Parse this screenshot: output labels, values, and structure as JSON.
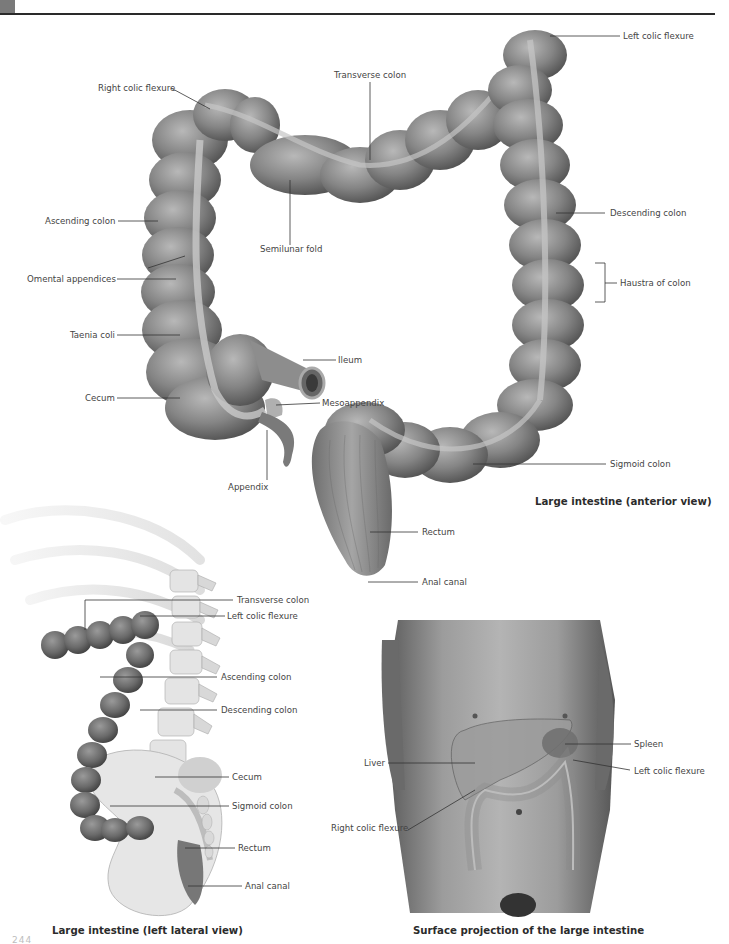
{
  "page": {
    "page_number": "244"
  },
  "figures": {
    "anterior": {
      "caption": "Large intestine (anterior view)",
      "labels": {
        "left_colic_flexure": "Left colic flexure",
        "right_colic_flexure": "Right colic flexure",
        "transverse_colon": "Transverse colon",
        "ascending_colon": "Ascending colon",
        "semilunar_fold": "Semilunar fold",
        "descending_colon": "Descending colon",
        "haustra_of_colon": "Haustra of colon",
        "omental_appendices": "Omental appendices",
        "taenia_coli": "Taenia coli",
        "ileum": "Ileum",
        "cecum": "Cecum",
        "mesoappendix": "Mesoappendix",
        "appendix": "Appendix",
        "sigmoid_colon": "Sigmoid colon",
        "rectum": "Rectum",
        "anal_canal": "Anal canal"
      }
    },
    "lateral": {
      "caption": "Large intestine (left lateral view)",
      "labels": {
        "transverse_colon": "Transverse colon",
        "left_colic_flexure": "Left colic flexure",
        "ascending_colon": "Ascending colon",
        "descending_colon": "Descending colon",
        "cecum": "Cecum",
        "sigmoid_colon": "Sigmoid colon",
        "rectum": "Rectum",
        "anal_canal": "Anal canal"
      }
    },
    "surface": {
      "caption": "Surface projection of the large intestine",
      "labels": {
        "spleen": "Spleen",
        "liver": "Liver",
        "left_colic_flexure": "Left colic flexure",
        "right_colic_flexure": "Right colic flexure"
      }
    }
  },
  "colors": {
    "colon_dark": "#5a5a5a",
    "colon_mid": "#8a8a8a",
    "colon_light": "#b5b5b5",
    "bone": "#e6e6e6",
    "skin": "#9a9a9a",
    "leader_line": "#333333"
  }
}
